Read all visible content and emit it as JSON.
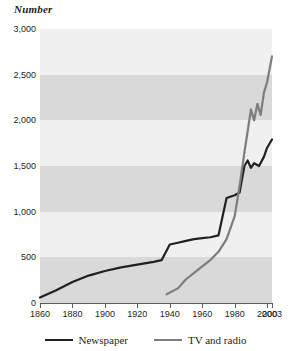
{
  "chart_data": {
    "type": "line",
    "title": "Number",
    "xlabel": "",
    "ylabel": "Number",
    "xlim": [
      1860,
      2003
    ],
    "ylim": [
      0,
      3000
    ],
    "grid": "horizontal-bands",
    "legend_position": "bottom",
    "x_ticks": [
      "1860",
      "1880",
      "1900",
      "1920",
      "1940",
      "1960",
      "1980",
      "2000",
      "2003"
    ],
    "x_tick_values": [
      1860,
      1880,
      1900,
      1920,
      1940,
      1960,
      1980,
      2000,
      2003
    ],
    "y_ticks": [
      "0",
      "500",
      "1,000",
      "1,500",
      "2,000",
      "2,500",
      "3,000"
    ],
    "y_tick_values": [
      0,
      500,
      1000,
      1500,
      2000,
      2500,
      3000
    ],
    "series": [
      {
        "name": "Newspaper",
        "color": "#231f20",
        "x": [
          1860,
          1870,
          1880,
          1890,
          1900,
          1910,
          1920,
          1930,
          1935,
          1940,
          1945,
          1950,
          1955,
          1960,
          1965,
          1970,
          1975,
          1980,
          1983,
          1986,
          1988,
          1990,
          1992,
          1995,
          1998,
          2000,
          2003
        ],
        "values": [
          60,
          140,
          230,
          300,
          350,
          390,
          420,
          450,
          470,
          640,
          660,
          680,
          700,
          710,
          720,
          740,
          1150,
          1180,
          1210,
          1500,
          1560,
          1480,
          1530,
          1500,
          1600,
          1700,
          1790
        ]
      },
      {
        "name": "TV and radio",
        "color": "#7d7d7d",
        "x": [
          1938,
          1945,
          1950,
          1955,
          1960,
          1965,
          1970,
          1975,
          1980,
          1983,
          1986,
          1988,
          1990,
          1992,
          1994,
          1996,
          1998,
          2000,
          2003
        ],
        "values": [
          95,
          160,
          260,
          330,
          400,
          470,
          560,
          700,
          950,
          1280,
          1650,
          1880,
          2120,
          2000,
          2180,
          2060,
          2300,
          2420,
          2700
        ]
      }
    ],
    "bands": [
      {
        "from": 0,
        "to": 500,
        "color": "#d9d9d9"
      },
      {
        "from": 500,
        "to": 1000,
        "color": "#f0f0f0"
      },
      {
        "from": 1000,
        "to": 1500,
        "color": "#d9d9d9"
      },
      {
        "from": 1500,
        "to": 2000,
        "color": "#f0f0f0"
      },
      {
        "from": 2000,
        "to": 2500,
        "color": "#d9d9d9"
      },
      {
        "from": 2500,
        "to": 3000,
        "color": "#f0f0f0"
      }
    ]
  },
  "legend": {
    "entries": [
      {
        "label": "Newspaper",
        "color": "#231f20"
      },
      {
        "label": "TV and radio",
        "color": "#7d7d7d"
      }
    ]
  }
}
